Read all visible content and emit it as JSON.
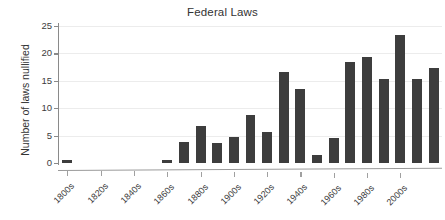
{
  "chart_data": {
    "type": "bar",
    "title": "Federal Laws",
    "xlabel": "",
    "ylabel": "Number of laws nullified",
    "ylim": [
      0,
      25
    ],
    "yticks": [
      0,
      5,
      10,
      15,
      20,
      25
    ],
    "grid": true,
    "legend": false,
    "bar_color": "#3d3d3d",
    "categories": [
      "1800s",
      "1810s",
      "1820s",
      "1830s",
      "1840s",
      "1850s",
      "1860s",
      "1870s",
      "1880s",
      "1890s",
      "1900s",
      "1910s",
      "1920s",
      "1930s",
      "1940s",
      "1950s",
      "1960s",
      "1970s",
      "1980s",
      "1990s",
      "2000s",
      "2010s"
    ],
    "tick_labels": [
      "1800s",
      "1820s",
      "1840s",
      "1860s",
      "1880s",
      "1900s",
      "1920s",
      "1940s",
      "1960s",
      "1980s",
      "2000s"
    ],
    "values": [
      0.6,
      0,
      0,
      0,
      0,
      0,
      0.6,
      3.8,
      6.8,
      3.7,
      4.7,
      8.7,
      5.6,
      16.6,
      13.5,
      1.5,
      4.5,
      18.5,
      19.4,
      15.4,
      23.3,
      15.4
    ],
    "values_extra": [
      17.3
    ]
  }
}
